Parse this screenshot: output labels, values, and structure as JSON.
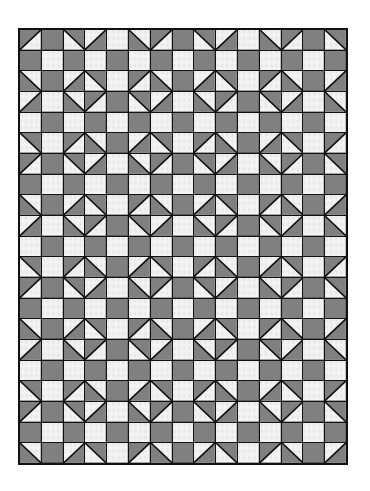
{
  "quilt": {
    "columns": 15,
    "rows": 21,
    "colors": {
      "dark_fill": "#8c8c8c",
      "dark_hatch": "#5e5e5e",
      "light_fill": "#f4f4f4",
      "light_dot": "#555555",
      "seam": "#111111"
    },
    "legend": {
      "D": "dark solid square",
      "L": "light dotted square",
      "TL": "half-square triangle, dark in top-left",
      "TR": "half-square triangle, dark in top-right",
      "BL": "half-square triangle, dark in bottom-left",
      "BR": "half-square triangle, dark in bottom-right"
    },
    "grid": [
      [
        "TL",
        "D",
        "TR",
        "BR",
        "L",
        "BL",
        "TL",
        "D",
        "TR",
        "BR",
        "L",
        "BL",
        "TL",
        "D",
        "TR"
      ],
      [
        "D",
        "L",
        "D",
        "L",
        "D",
        "L",
        "D",
        "L",
        "D",
        "L",
        "D",
        "L",
        "D",
        "L",
        "D"
      ],
      [
        "BL",
        "D",
        "BR",
        "TR",
        "L",
        "TL",
        "BL",
        "D",
        "BR",
        "TR",
        "L",
        "TL",
        "BL",
        "D",
        "BR"
      ],
      [
        "BR",
        "L",
        "BL",
        "TL",
        "D",
        "TR",
        "BR",
        "L",
        "BL",
        "TL",
        "D",
        "TR",
        "BR",
        "L",
        "BL"
      ],
      [
        "L",
        "D",
        "L",
        "D",
        "L",
        "D",
        "L",
        "D",
        "L",
        "D",
        "L",
        "D",
        "L",
        "D",
        "L"
      ],
      [
        "TR",
        "L",
        "TL",
        "BL",
        "D",
        "BR",
        "TR",
        "L",
        "TL",
        "BL",
        "D",
        "BR",
        "TR",
        "L",
        "TL"
      ],
      [
        "TL",
        "D",
        "TR",
        "BR",
        "L",
        "BL",
        "TL",
        "D",
        "TR",
        "BR",
        "L",
        "BL",
        "TL",
        "D",
        "TR"
      ],
      [
        "D",
        "L",
        "D",
        "L",
        "D",
        "L",
        "D",
        "L",
        "D",
        "L",
        "D",
        "L",
        "D",
        "L",
        "D"
      ],
      [
        "BL",
        "D",
        "BR",
        "TR",
        "L",
        "TL",
        "BL",
        "D",
        "BR",
        "TR",
        "L",
        "TL",
        "BL",
        "D",
        "BR"
      ],
      [
        "BR",
        "L",
        "BL",
        "TL",
        "D",
        "TR",
        "BR",
        "L",
        "BL",
        "TL",
        "D",
        "TR",
        "BR",
        "L",
        "BL"
      ],
      [
        "L",
        "D",
        "L",
        "D",
        "L",
        "D",
        "L",
        "D",
        "L",
        "D",
        "L",
        "D",
        "L",
        "D",
        "L"
      ],
      [
        "TR",
        "L",
        "TL",
        "BL",
        "D",
        "BR",
        "TR",
        "L",
        "TL",
        "BL",
        "D",
        "BR",
        "TR",
        "L",
        "TL"
      ],
      [
        "TL",
        "D",
        "TR",
        "BR",
        "L",
        "BL",
        "TL",
        "D",
        "TR",
        "BR",
        "L",
        "BL",
        "TL",
        "D",
        "TR"
      ],
      [
        "D",
        "L",
        "D",
        "L",
        "D",
        "L",
        "D",
        "L",
        "D",
        "L",
        "D",
        "L",
        "D",
        "L",
        "D"
      ],
      [
        "BL",
        "D",
        "BR",
        "TR",
        "L",
        "TL",
        "BL",
        "D",
        "BR",
        "TR",
        "L",
        "TL",
        "BL",
        "D",
        "BR"
      ],
      [
        "BR",
        "L",
        "BL",
        "TL",
        "D",
        "TR",
        "BR",
        "L",
        "BL",
        "TL",
        "D",
        "TR",
        "BR",
        "L",
        "BL"
      ],
      [
        "L",
        "D",
        "L",
        "D",
        "L",
        "D",
        "L",
        "D",
        "L",
        "D",
        "L",
        "D",
        "L",
        "D",
        "L"
      ],
      [
        "TR",
        "L",
        "TL",
        "BL",
        "D",
        "BR",
        "TR",
        "L",
        "TL",
        "BL",
        "D",
        "BR",
        "TR",
        "L",
        "TL"
      ],
      [
        "TL",
        "D",
        "TR",
        "BR",
        "L",
        "BL",
        "TL",
        "D",
        "TR",
        "BR",
        "L",
        "BL",
        "TL",
        "D",
        "TR"
      ],
      [
        "D",
        "L",
        "D",
        "L",
        "D",
        "L",
        "D",
        "L",
        "D",
        "L",
        "D",
        "L",
        "D",
        "L",
        "D"
      ],
      [
        "BL",
        "D",
        "BR",
        "TR",
        "L",
        "TL",
        "BL",
        "D",
        "BR",
        "TR",
        "L",
        "TL",
        "BL",
        "D",
        "BR"
      ]
    ]
  }
}
